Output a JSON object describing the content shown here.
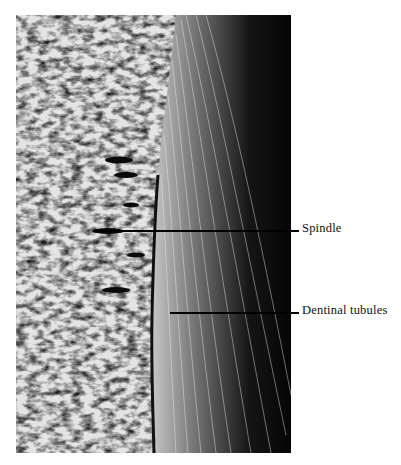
{
  "figure": {
    "labels": [
      {
        "id": "spindle",
        "text": "Spindle"
      },
      {
        "id": "dentinal-tubules",
        "text": "Dentinal tubules"
      }
    ]
  },
  "colors": {
    "background": "#ffffff",
    "ink": "#000000",
    "enamel_light": "#e6e6e6",
    "dentin_dark": "#0a0a0a"
  }
}
